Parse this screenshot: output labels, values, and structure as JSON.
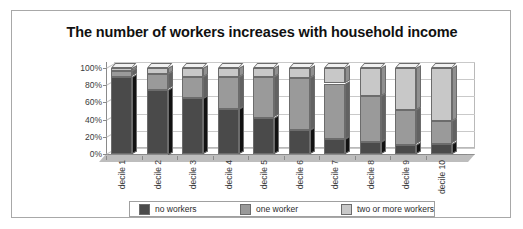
{
  "chart_data": {
    "type": "bar",
    "subtype": "stacked-percentage-3d-column",
    "title": "The number of workers increases with household income",
    "xlabel": "",
    "ylabel": "",
    "ylim": [
      0,
      100
    ],
    "yticks": [
      "0%",
      "20%",
      "40%",
      "60%",
      "80%",
      "100%"
    ],
    "ytick_values": [
      0,
      20,
      40,
      60,
      80,
      100
    ],
    "grid": true,
    "legend_position": "bottom",
    "stacked_total": 100,
    "categories": [
      "decile 1",
      "decile 2",
      "decile 3",
      "decile 4",
      "decile 5",
      "decile 6",
      "decile 7",
      "decile 8",
      "decile 9",
      "decile 10"
    ],
    "series": [
      {
        "name": "no workers",
        "color": "#4a4a4a",
        "values": [
          90,
          75,
          65,
          52,
          42,
          28,
          18,
          14,
          11,
          12
        ]
      },
      {
        "name": "one worker",
        "color": "#9a9a9a",
        "values": [
          6,
          18,
          25,
          37,
          47,
          60,
          64,
          54,
          40,
          26
        ]
      },
      {
        "name": "two or more workers",
        "color": "#c8c8c8",
        "values": [
          4,
          7,
          10,
          11,
          11,
          12,
          18,
          32,
          49,
          62
        ]
      }
    ]
  },
  "colors": {
    "no_workers": "#4a4a4a",
    "one_worker": "#9a9a9a",
    "two_or_more_workers": "#c8c8c8",
    "frame_border": "#a8a8a8",
    "gridline": "#c9c9c9",
    "axis": "#8a8a8a",
    "background": "#ffffff"
  }
}
